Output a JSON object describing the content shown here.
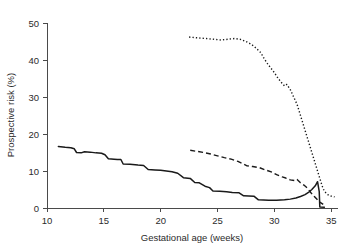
{
  "chart_data": {
    "type": "line",
    "title": "",
    "xlabel": "Gestational age (weeks)",
    "ylabel": "Prospective risk (%)",
    "xlim": [
      10,
      35.6
    ],
    "ylim": [
      0,
      50
    ],
    "xticks": [
      10,
      15,
      20,
      25,
      30,
      35
    ],
    "xticklabels": [
      "10",
      "15",
      "20",
      "25",
      "30",
      "35"
    ],
    "yticks": [
      0,
      10,
      20,
      30,
      40,
      50
    ],
    "yticklabels": [
      "0",
      "10",
      "20",
      "30",
      "40",
      "50"
    ],
    "grid": false,
    "legend": "none",
    "series": [
      {
        "name": "solid-line",
        "style": "solid",
        "color": "#1a1a1a",
        "points": [
          [
            11.0,
            16.6
          ],
          [
            11.6,
            16.4
          ],
          [
            12.1,
            16.3
          ],
          [
            12.4,
            16.0
          ],
          [
            12.6,
            15.0
          ],
          [
            13.0,
            14.9
          ],
          [
            13.3,
            15.2
          ],
          [
            13.8,
            15.1
          ],
          [
            14.3,
            14.9
          ],
          [
            14.8,
            14.8
          ],
          [
            15.1,
            14.4
          ],
          [
            15.4,
            13.3
          ],
          [
            15.9,
            13.2
          ],
          [
            16.2,
            13.1
          ],
          [
            16.5,
            13.1
          ],
          [
            16.7,
            11.9
          ],
          [
            17.3,
            11.8
          ],
          [
            18.0,
            11.6
          ],
          [
            18.5,
            11.5
          ],
          [
            18.9,
            10.4
          ],
          [
            19.5,
            10.3
          ],
          [
            20.0,
            10.2
          ],
          [
            20.5,
            10.0
          ],
          [
            21.0,
            9.8
          ],
          [
            21.5,
            9.4
          ],
          [
            22.0,
            8.2
          ],
          [
            22.6,
            8.0
          ],
          [
            23.0,
            6.9
          ],
          [
            23.4,
            6.8
          ],
          [
            23.9,
            5.9
          ],
          [
            24.3,
            5.5
          ],
          [
            24.6,
            4.6
          ],
          [
            25.2,
            4.5
          ],
          [
            25.8,
            4.4
          ],
          [
            26.3,
            4.2
          ],
          [
            26.9,
            4.1
          ],
          [
            27.3,
            3.3
          ],
          [
            28.2,
            3.2
          ],
          [
            28.6,
            2.2
          ],
          [
            29.5,
            2.1
          ],
          [
            30.2,
            2.1
          ],
          [
            30.9,
            2.2
          ],
          [
            31.4,
            2.4
          ],
          [
            31.9,
            2.7
          ],
          [
            32.3,
            3.1
          ],
          [
            32.7,
            3.6
          ],
          [
            33.0,
            4.2
          ],
          [
            33.3,
            5.0
          ],
          [
            33.6,
            6.0
          ],
          [
            33.8,
            7.1
          ],
          [
            33.95,
            4.4
          ],
          [
            34.0,
            0.3
          ],
          [
            34.4,
            0.2
          ]
        ]
      },
      {
        "name": "dashed-line",
        "style": "dashed",
        "color": "#1a1a1a",
        "points": [
          [
            22.6,
            15.6
          ],
          [
            23.2,
            15.3
          ],
          [
            23.8,
            15.0
          ],
          [
            24.4,
            14.6
          ],
          [
            25.0,
            14.1
          ],
          [
            25.6,
            13.6
          ],
          [
            26.2,
            13.2
          ],
          [
            26.8,
            12.6
          ],
          [
            27.2,
            12.0
          ],
          [
            27.6,
            11.4
          ],
          [
            28.1,
            11.2
          ],
          [
            28.7,
            10.9
          ],
          [
            29.2,
            10.3
          ],
          [
            29.8,
            9.7
          ],
          [
            30.2,
            9.0
          ],
          [
            30.7,
            8.4
          ],
          [
            31.0,
            8.1
          ],
          [
            31.4,
            7.6
          ],
          [
            31.8,
            7.4
          ],
          [
            32.0,
            7.7
          ],
          [
            32.3,
            6.8
          ],
          [
            32.6,
            6.2
          ],
          [
            32.9,
            5.4
          ],
          [
            33.2,
            4.2
          ],
          [
            33.5,
            3.2
          ],
          [
            33.8,
            2.2
          ],
          [
            34.0,
            1.6
          ],
          [
            34.3,
            1.0
          ]
        ]
      },
      {
        "name": "dotted-line",
        "style": "dotted",
        "color": "#1a1a1a",
        "points": [
          [
            22.5,
            46.2
          ],
          [
            23.2,
            46.0
          ],
          [
            24.0,
            45.8
          ],
          [
            24.7,
            45.6
          ],
          [
            25.3,
            45.4
          ],
          [
            25.9,
            45.6
          ],
          [
            26.5,
            45.8
          ],
          [
            27.0,
            45.6
          ],
          [
            27.5,
            45.0
          ],
          [
            28.0,
            44.2
          ],
          [
            28.4,
            43.2
          ],
          [
            28.8,
            42.0
          ],
          [
            29.1,
            40.4
          ],
          [
            29.4,
            39.0
          ],
          [
            29.7,
            37.8
          ],
          [
            30.0,
            36.6
          ],
          [
            30.3,
            35.2
          ],
          [
            30.6,
            34.0
          ],
          [
            30.9,
            33.0
          ],
          [
            31.1,
            33.4
          ],
          [
            31.4,
            32.0
          ],
          [
            31.7,
            30.0
          ],
          [
            32.0,
            28.0
          ],
          [
            32.2,
            26.0
          ],
          [
            32.4,
            24.0
          ],
          [
            32.6,
            22.0
          ],
          [
            32.8,
            20.0
          ],
          [
            33.0,
            18.0
          ],
          [
            33.2,
            16.0
          ],
          [
            33.4,
            14.0
          ],
          [
            33.6,
            12.0
          ],
          [
            33.8,
            10.0
          ],
          [
            34.0,
            8.0
          ],
          [
            34.2,
            6.0
          ],
          [
            34.4,
            4.5
          ],
          [
            34.7,
            3.6
          ],
          [
            35.0,
            3.2
          ],
          [
            35.3,
            3.0
          ]
        ]
      }
    ]
  }
}
